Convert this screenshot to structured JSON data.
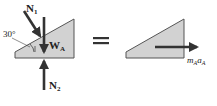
{
  "diagram": {
    "type": "free-body / kinetic diagram",
    "left": {
      "forces": {
        "n1": {
          "label": "N",
          "sub": "1"
        },
        "wa": {
          "label": "W",
          "sub": "A"
        },
        "n2": {
          "label": "N",
          "sub": "2"
        }
      },
      "angle": {
        "label": "30°"
      }
    },
    "equals": "=",
    "right": {
      "inertial": {
        "label_m": "m",
        "sub_m": "A",
        "label_a": "a",
        "sub_a": "A"
      }
    },
    "colors": {
      "fill": "#d2d2d2",
      "stroke": "#555555",
      "arrow": "#333333"
    }
  }
}
